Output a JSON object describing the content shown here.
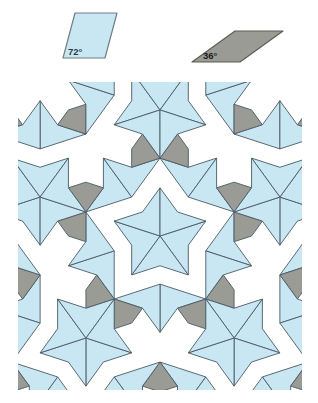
{
  "figure": {
    "kind": "penrose-rhombus-tiling",
    "title_visible": false
  },
  "legend": {
    "fat_rhombus": {
      "name": "fat-rhombus",
      "angle_label": "72°",
      "fill": "#c9e6f3",
      "stroke": "#6f7f86",
      "points": "75,13 117,13 105,58 63,58"
    },
    "thin_rhombus": {
      "name": "thin-rhombus",
      "angle_label": "36°",
      "fill": "#9b9b95",
      "stroke": "#5d5d58",
      "points": "235,31 283,31 240,62 192,62"
    }
  },
  "tiling": {
    "fat_fill": "#c9e6f3",
    "thin_fill": "#9b9b95",
    "stroke": "#4a5a63",
    "stroke_width": 0.9,
    "background": "#ffffff",
    "generations": 5,
    "fat_angle": "72°",
    "thin_angle": "36°",
    "clip": {
      "x": 18,
      "y": 4,
      "width": 284,
      "height": 308
    },
    "viewbox": "0 0 318 318"
  },
  "chart_data": {
    "type": "diagram",
    "legend_entries": [
      {
        "label": "72°",
        "shape": "fat rhombus",
        "color": "#c9e6f3"
      },
      {
        "label": "36°",
        "shape": "thin rhombus",
        "color": "#9b9b95"
      }
    ],
    "annotations": [
      "72°",
      "36°"
    ]
  }
}
